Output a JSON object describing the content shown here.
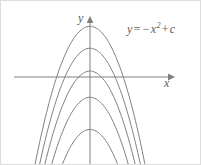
{
  "figure": {
    "background_color": "#ffffff",
    "line_color": "#808080",
    "text_color": "#5a5a5a",
    "border_color": "#dcdcdc"
  },
  "labels": {
    "equation_y": "y",
    "equation_equals": "=",
    "equation_minus": "−",
    "equation_x": "x",
    "equation_exponent": "2",
    "equation_plus": "+",
    "equation_c": "c",
    "equation_full": "y = −x² + c",
    "y_axis": "y",
    "x_axis": "x"
  },
  "chart_data": {
    "type": "line",
    "xlabel": "x",
    "ylabel": "y",
    "grid": false,
    "legend": false,
    "axis_arrows": {
      "x_axis_arrow": "right",
      "y_axis_arrow": "up"
    },
    "xlim": [
      -5.2,
      5.2
    ],
    "ylim": [
      -6.5,
      3.2
    ],
    "origin_px": [
      89,
      76
    ],
    "series": [
      {
        "name": "c = 3",
        "equation": "y = -x^2 + 3",
        "c": 3,
        "vertex": [
          0,
          3
        ],
        "vertex_px": [
          89,
          29
        ],
        "x_intercepts": [
          -1.73,
          1.73
        ]
      },
      {
        "name": "c = 1.7",
        "equation": "y = -x^2 + 1.7",
        "c": 1.7,
        "vertex": [
          0,
          1.7
        ],
        "vertex_px": [
          89,
          50
        ],
        "x_intercepts": [
          -1.3,
          1.3
        ]
      },
      {
        "name": "c = 0.35",
        "equation": "y = -x^2 + 0.35",
        "c": 0.35,
        "vertex": [
          0,
          0.35
        ],
        "vertex_px": [
          89,
          71
        ],
        "x_intercepts": [
          -0.59,
          0.59
        ]
      },
      {
        "name": "c = -1.2",
        "equation": "y = -x^2 - 1.2",
        "c": -1.2,
        "vertex": [
          0,
          -1.2
        ],
        "vertex_px": [
          89,
          95
        ],
        "x_intercepts": []
      },
      {
        "name": "c = -3.1",
        "equation": "y = -x^2 - 3.1",
        "c": -3.1,
        "vertex": [
          0,
          -3.1
        ],
        "vertex_px": [
          89,
          125
        ],
        "x_intercepts": []
      }
    ]
  }
}
